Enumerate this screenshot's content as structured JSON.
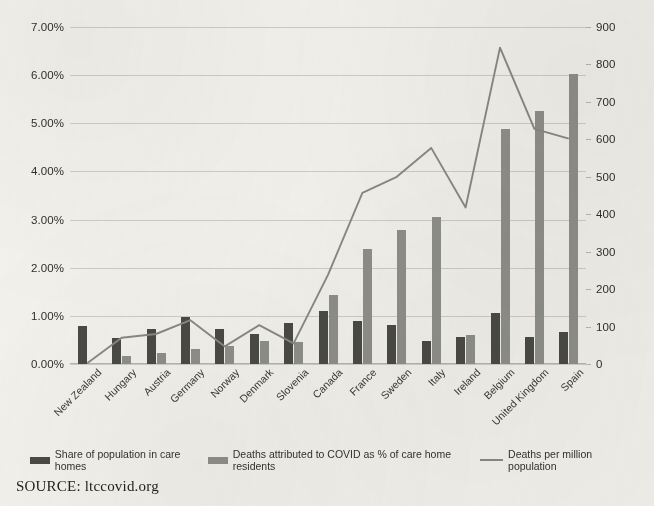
{
  "source_note": "SOURCE: ltccovid.org",
  "legend": {
    "position": "bottom",
    "items": [
      {
        "label": "Share of population in care homes",
        "marker": "dark-bar-swatch",
        "color": "#4b4b45"
      },
      {
        "label": "Deaths attributed to COVID as % of care home residents",
        "marker": "light-bar-swatch",
        "color": "#90908a"
      },
      {
        "label": "Deaths per million population",
        "marker": "line-swatch",
        "color": "#8a8a82"
      }
    ]
  },
  "chart_data": {
    "type": "bar",
    "title": "",
    "subtitle": "",
    "xlabel": "",
    "ylabel": "",
    "grid": true,
    "legend_position": "bottom",
    "categories": [
      "New Zealand",
      "Hungary",
      "Austria",
      "Germany",
      "Norway",
      "Denmark",
      "Slovenia",
      "Canada",
      "France",
      "Sweden",
      "Italy",
      "Ireland",
      "Belgium",
      "United Kingdom",
      "Spain"
    ],
    "axes": {
      "left": {
        "label": "",
        "ticks": [
          "0.00%",
          "1.00%",
          "2.00%",
          "3.00%",
          "4.00%",
          "5.00%",
          "6.00%",
          "7.00%"
        ],
        "tick_values": [
          0,
          1,
          2,
          3,
          4,
          5,
          6,
          7
        ],
        "ylim": [
          0,
          7
        ],
        "unit": "percent"
      },
      "right": {
        "label": "",
        "ticks": [
          "0",
          "100",
          "200",
          "300",
          "400",
          "500",
          "600",
          "700",
          "800",
          "900"
        ],
        "tick_values": [
          0,
          100,
          200,
          300,
          400,
          500,
          600,
          700,
          800,
          900
        ],
        "ylim": [
          0,
          900
        ],
        "unit": "deaths per million"
      }
    },
    "series": [
      {
        "name": "Share of population in care homes",
        "type": "bar",
        "axis": "left",
        "color": "#4b4b45",
        "values": [
          0.78,
          0.53,
          0.72,
          0.98,
          0.73,
          0.63,
          0.86,
          1.11,
          0.89,
          0.81,
          0.47,
          0.56,
          1.07,
          0.57,
          0.67
        ]
      },
      {
        "name": "Deaths attributed to COVID as % of care home residents",
        "type": "bar",
        "axis": "left",
        "color": "#90908a",
        "values": [
          0.0,
          0.17,
          0.23,
          0.32,
          0.37,
          0.47,
          0.45,
          1.44,
          2.38,
          2.78,
          3.06,
          0.61,
          4.88,
          5.25,
          6.03
        ]
      },
      {
        "name": "Deaths per million population",
        "type": "line",
        "axis": "right",
        "color": "#8a8a82",
        "values": [
          2,
          70,
          80,
          117,
          47,
          104,
          55,
          238,
          457,
          500,
          577,
          418,
          845,
          628,
          602
        ]
      }
    ]
  }
}
